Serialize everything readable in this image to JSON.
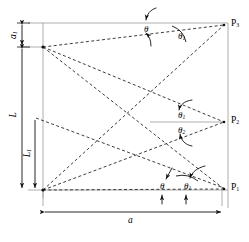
{
  "figure": {
    "type": "geometry-diagram"
  },
  "dimensions": {
    "width_label": "a",
    "top_offset_label": "a",
    "top_offset_sub": "1",
    "height_label": "L",
    "inner_height_label": "L",
    "inner_height_sub": "1"
  },
  "points": [
    {
      "name": "P",
      "sub": "3",
      "data_name": "point-p3"
    },
    {
      "name": "P",
      "sub": "2",
      "data_name": "point-p2"
    },
    {
      "name": "P",
      "sub": "1",
      "data_name": "point-p1"
    }
  ],
  "angles": [
    {
      "id": "top-theta",
      "symbol": "θ",
      "sub": "",
      "x": 144,
      "y": 25
    },
    {
      "id": "top-theta-1",
      "symbol": "θ",
      "sub": "1",
      "x": 178,
      "y": 32
    },
    {
      "id": "mid-theta-1",
      "symbol": "θ",
      "sub": "1",
      "x": 178,
      "y": 114
    },
    {
      "id": "mid-theta-2",
      "symbol": "θ",
      "sub": "2",
      "x": 178,
      "y": 130
    },
    {
      "id": "bottom-theta",
      "symbol": "θ",
      "sub": "",
      "x": 160,
      "y": 186
    },
    {
      "id": "bottom-theta-1",
      "symbol": "θ",
      "sub": "1",
      "x": 185,
      "y": 186
    }
  ],
  "colors": {
    "line": "#1a1a1a",
    "frame": "#8a8a8a",
    "background": "#ffffff"
  },
  "strokes": {
    "dashed_pattern": "3 2.4",
    "solid_width": "0.9",
    "dashed_width": "0.85"
  }
}
